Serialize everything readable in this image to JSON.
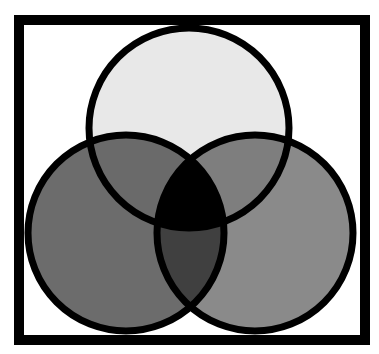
{
  "diagram": {
    "type": "venn",
    "sets": 3,
    "frame": {
      "x": 19,
      "y": 20,
      "width": 346,
      "height": 320,
      "stroke": "#000000",
      "stroke_width": 10,
      "fill": "#ffffff"
    },
    "circles": [
      {
        "id": "top",
        "cx": 189,
        "cy": 128,
        "r": 100,
        "fill": "#e8e8e8"
      },
      {
        "id": "left",
        "cx": 126,
        "cy": 233,
        "r": 98,
        "fill": "#6c6c6c"
      },
      {
        "id": "right",
        "cx": 255,
        "cy": 233,
        "r": 98,
        "fill": "#8a8a8a"
      }
    ],
    "intersections": {
      "top_left": "#6a6a6a",
      "top_right": "#7e7e7e",
      "left_right": "#404040",
      "all_three": "#000000"
    },
    "outline": {
      "stroke": "#000000",
      "stroke_width": 7
    }
  }
}
